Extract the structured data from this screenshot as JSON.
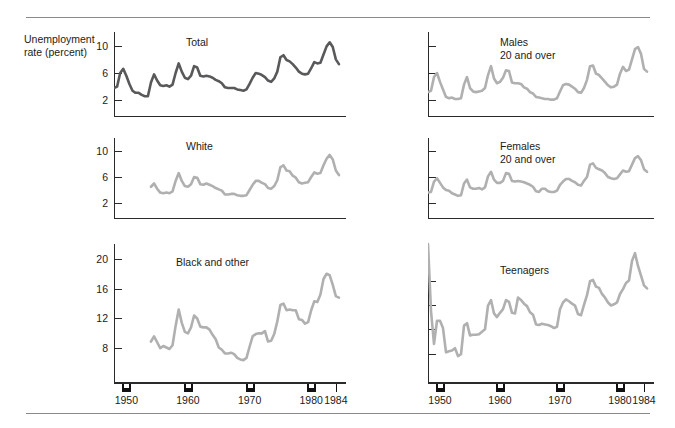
{
  "figure": {
    "axis_caption": "Unemployment\nrate (percent)",
    "line_color_primary": "#59595b",
    "line_color_secondary": "#b0b0b0",
    "axis_color": "#2a2a2a",
    "rule_color": "#8a8a8a"
  },
  "xaxis": {
    "tick_labels": [
      "1950",
      "1960",
      "1970",
      "1980",
      "1984"
    ],
    "tick_years": [
      1950,
      1960,
      1970,
      1980,
      1984
    ],
    "range": [
      1948,
      1985
    ]
  },
  "chart_data": [
    {
      "type": "line",
      "title": "Total",
      "panel": "top-left",
      "ylabel": "Unemployment rate (percent)",
      "xlabel": "",
      "ylim": [
        0,
        12
      ],
      "yticks": [
        2,
        6,
        10
      ],
      "ytick_labels": [
        "2",
        "6",
        "10"
      ],
      "grid": false,
      "legend": "none",
      "color": "#59595b",
      "x": [
        1948,
        1948.5,
        1949,
        1949.5,
        1950,
        1950.5,
        1951,
        1951.5,
        1952,
        1952.5,
        1953,
        1953.5,
        1954,
        1954.5,
        1955,
        1955.5,
        1956,
        1956.5,
        1957,
        1957.5,
        1958,
        1958.5,
        1959,
        1959.5,
        1960,
        1960.5,
        1961,
        1961.5,
        1962,
        1962.5,
        1963,
        1963.5,
        1964,
        1964.5,
        1965,
        1965.5,
        1966,
        1966.5,
        1967,
        1967.5,
        1968,
        1968.5,
        1969,
        1969.5,
        1970,
        1970.5,
        1971,
        1971.5,
        1972,
        1972.5,
        1973,
        1973.5,
        1974,
        1974.5,
        1975,
        1975.5,
        1976,
        1976.5,
        1977,
        1977.5,
        1978,
        1978.5,
        1979,
        1979.5,
        1980,
        1980.5,
        1981,
        1981.5,
        1982,
        1982.5,
        1983,
        1983.5,
        1984,
        1984.5
      ],
      "y": [
        3.8,
        4.0,
        6.0,
        6.6,
        5.6,
        4.4,
        3.4,
        3.1,
        3.1,
        2.8,
        2.6,
        2.6,
        4.6,
        5.8,
        4.9,
        4.2,
        4.1,
        4.2,
        4.0,
        4.3,
        6.0,
        7.4,
        6.2,
        5.3,
        5.1,
        5.6,
        7.0,
        6.8,
        5.6,
        5.5,
        5.6,
        5.5,
        5.3,
        5.0,
        4.8,
        4.5,
        3.9,
        3.8,
        3.8,
        3.8,
        3.6,
        3.5,
        3.4,
        3.6,
        4.4,
        5.3,
        6.0,
        5.9,
        5.7,
        5.4,
        4.9,
        4.7,
        5.2,
        6.2,
        8.3,
        8.6,
        7.9,
        7.7,
        7.3,
        6.8,
        6.2,
        5.9,
        5.8,
        5.9,
        6.7,
        7.6,
        7.4,
        7.5,
        8.7,
        9.9,
        10.5,
        9.8,
        8.0,
        7.3
      ],
      "notes": "line drawn darker than the other five panels"
    },
    {
      "type": "line",
      "title": "White",
      "panel": "middle-left",
      "ylabel": "",
      "xlabel": "",
      "ylim": [
        0,
        12
      ],
      "yticks": [
        2,
        6,
        10
      ],
      "ytick_labels": [
        "2",
        "6",
        "10"
      ],
      "grid": false,
      "legend": "none",
      "color": "#b0b0b0",
      "x": [
        1954,
        1954.5,
        1955,
        1955.5,
        1956,
        1956.5,
        1957,
        1957.5,
        1958,
        1958.5,
        1959,
        1959.5,
        1960,
        1960.5,
        1961,
        1961.5,
        1962,
        1962.5,
        1963,
        1963.5,
        1964,
        1964.5,
        1965,
        1965.5,
        1966,
        1966.5,
        1967,
        1967.5,
        1968,
        1968.5,
        1969,
        1969.5,
        1970,
        1970.5,
        1971,
        1971.5,
        1972,
        1972.5,
        1973,
        1973.5,
        1974,
        1974.5,
        1975,
        1975.5,
        1976,
        1976.5,
        1977,
        1977.5,
        1978,
        1978.5,
        1979,
        1979.5,
        1980,
        1980.5,
        1981,
        1981.5,
        1982,
        1982.5,
        1983,
        1983.5,
        1984,
        1984.5
      ],
      "y": [
        4.5,
        5.0,
        4.2,
        3.6,
        3.5,
        3.6,
        3.5,
        3.8,
        5.4,
        6.6,
        5.4,
        4.6,
        4.5,
        4.9,
        6.0,
        5.9,
        4.9,
        4.8,
        5.0,
        4.8,
        4.6,
        4.3,
        4.1,
        3.9,
        3.3,
        3.3,
        3.4,
        3.4,
        3.2,
        3.1,
        3.1,
        3.2,
        4.0,
        4.8,
        5.4,
        5.4,
        5.1,
        4.9,
        4.3,
        4.2,
        4.6,
        5.5,
        7.5,
        7.8,
        7.0,
        6.9,
        6.2,
        5.9,
        5.2,
        5.0,
        5.1,
        5.2,
        6.0,
        6.7,
        6.5,
        6.6,
        7.8,
        8.8,
        9.4,
        8.7,
        7.0,
        6.3
      ],
      "notes": "series begins about 1954"
    },
    {
      "type": "line",
      "title": "Black and other",
      "panel": "bottom-left",
      "ylabel": "",
      "xlabel": "",
      "ylim": [
        4,
        22
      ],
      "yticks": [
        8,
        12,
        16,
        20
      ],
      "ytick_labels": [
        "8",
        "12",
        "16",
        "20"
      ],
      "grid": false,
      "legend": "none",
      "color": "#b0b0b0",
      "x": [
        1954,
        1954.5,
        1955,
        1955.5,
        1956,
        1956.5,
        1957,
        1957.5,
        1958,
        1958.5,
        1959,
        1959.5,
        1960,
        1960.5,
        1961,
        1961.5,
        1962,
        1962.5,
        1963,
        1963.5,
        1964,
        1964.5,
        1965,
        1965.5,
        1966,
        1966.5,
        1967,
        1967.5,
        1968,
        1968.5,
        1969,
        1969.5,
        1970,
        1970.5,
        1971,
        1971.5,
        1972,
        1972.5,
        1973,
        1973.5,
        1974,
        1974.5,
        1975,
        1975.5,
        1976,
        1976.5,
        1977,
        1977.5,
        1978,
        1978.5,
        1979,
        1979.5,
        1980,
        1980.5,
        1981,
        1981.5,
        1982,
        1982.5,
        1983,
        1983.5,
        1984,
        1984.5
      ],
      "y": [
        8.9,
        9.6,
        8.8,
        8.0,
        8.3,
        8.1,
        7.9,
        8.4,
        11.0,
        13.2,
        11.4,
        10.2,
        10.0,
        10.8,
        12.4,
        12.0,
        10.9,
        10.8,
        10.8,
        10.5,
        9.8,
        9.2,
        8.1,
        7.8,
        7.3,
        7.3,
        7.4,
        7.2,
        6.7,
        6.5,
        6.4,
        6.7,
        8.2,
        9.6,
        9.9,
        10.0,
        10.0,
        10.3,
        8.9,
        9.0,
        9.9,
        11.6,
        13.8,
        14.0,
        13.1,
        13.2,
        13.1,
        13.1,
        11.9,
        11.8,
        11.3,
        11.5,
        13.1,
        14.3,
        14.2,
        15.2,
        17.3,
        18.0,
        17.8,
        16.5,
        15.0,
        14.8
      ],
      "notes": "series begins about 1954"
    },
    {
      "type": "line",
      "title": "Males\n20 and over",
      "panel": "top-right",
      "ylabel": "",
      "xlabel": "",
      "ylim": [
        0,
        12
      ],
      "yticks": [
        2,
        6,
        10
      ],
      "ytick_labels": [
        "",
        "",
        ""
      ],
      "grid": false,
      "legend": "none",
      "color": "#b0b0b0",
      "x": [
        1948,
        1948.5,
        1949,
        1949.5,
        1950,
        1950.5,
        1951,
        1951.5,
        1952,
        1952.5,
        1953,
        1953.5,
        1954,
        1954.5,
        1955,
        1955.5,
        1956,
        1956.5,
        1957,
        1957.5,
        1958,
        1958.5,
        1959,
        1959.5,
        1960,
        1960.5,
        1961,
        1961.5,
        1962,
        1962.5,
        1963,
        1963.5,
        1964,
        1964.5,
        1965,
        1965.5,
        1966,
        1966.5,
        1967,
        1967.5,
        1968,
        1968.5,
        1969,
        1969.5,
        1970,
        1970.5,
        1971,
        1971.5,
        1972,
        1972.5,
        1973,
        1973.5,
        1974,
        1974.5,
        1975,
        1975.5,
        1976,
        1976.5,
        1977,
        1977.5,
        1978,
        1978.5,
        1979,
        1979.5,
        1980,
        1980.5,
        1981,
        1981.5,
        1982,
        1982.5,
        1983,
        1983.5,
        1984,
        1984.5
      ],
      "y": [
        3.2,
        3.4,
        5.4,
        6.0,
        4.7,
        3.6,
        2.5,
        2.3,
        2.4,
        2.2,
        2.2,
        2.3,
        4.3,
        5.4,
        3.8,
        3.3,
        3.2,
        3.3,
        3.4,
        3.8,
        5.7,
        7.0,
        5.2,
        4.5,
        4.7,
        5.3,
        6.4,
        6.3,
        4.6,
        4.5,
        4.5,
        4.4,
        3.9,
        3.7,
        3.2,
        3.0,
        2.5,
        2.4,
        2.3,
        2.2,
        2.2,
        2.1,
        2.1,
        2.3,
        3.3,
        4.2,
        4.4,
        4.3,
        4.0,
        3.7,
        3.2,
        3.1,
        3.8,
        5.0,
        7.0,
        7.1,
        5.9,
        5.7,
        5.2,
        4.7,
        4.2,
        3.9,
        4.0,
        4.3,
        5.9,
        6.9,
        6.3,
        6.5,
        8.0,
        9.5,
        9.8,
        8.8,
        6.6,
        6.2
      ]
    },
    {
      "type": "line",
      "title": "Females\n20 and over",
      "panel": "middle-right",
      "ylabel": "",
      "xlabel": "",
      "ylim": [
        0,
        12
      ],
      "yticks": [
        2,
        6,
        10
      ],
      "ytick_labels": [
        "",
        "",
        ""
      ],
      "grid": false,
      "legend": "none",
      "color": "#b0b0b0",
      "x": [
        1948,
        1948.5,
        1949,
        1949.5,
        1950,
        1950.5,
        1951,
        1951.5,
        1952,
        1952.5,
        1953,
        1953.5,
        1954,
        1954.5,
        1955,
        1955.5,
        1956,
        1956.5,
        1957,
        1957.5,
        1958,
        1958.5,
        1959,
        1959.5,
        1960,
        1960.5,
        1961,
        1961.5,
        1962,
        1962.5,
        1963,
        1963.5,
        1964,
        1964.5,
        1965,
        1965.5,
        1966,
        1966.5,
        1967,
        1967.5,
        1968,
        1968.5,
        1969,
        1969.5,
        1970,
        1970.5,
        1971,
        1971.5,
        1972,
        1972.5,
        1973,
        1973.5,
        1974,
        1974.5,
        1975,
        1975.5,
        1976,
        1976.5,
        1977,
        1977.5,
        1978,
        1978.5,
        1979,
        1979.5,
        1980,
        1980.5,
        1981,
        1981.5,
        1982,
        1982.5,
        1983,
        1983.5,
        1984,
        1984.5
      ],
      "y": [
        3.6,
        3.7,
        5.3,
        5.8,
        5.1,
        4.4,
        4.0,
        3.9,
        3.5,
        3.3,
        3.1,
        3.2,
        5.0,
        5.6,
        4.4,
        4.2,
        4.2,
        4.3,
        4.1,
        4.4,
        6.1,
        6.8,
        5.6,
        5.1,
        5.1,
        5.4,
        6.6,
        6.5,
        5.4,
        5.3,
        5.4,
        5.3,
        5.2,
        5.0,
        4.8,
        4.5,
        3.8,
        3.7,
        4.2,
        4.2,
        3.8,
        3.7,
        3.7,
        3.9,
        4.8,
        5.3,
        5.7,
        5.7,
        5.4,
        5.2,
        4.8,
        4.7,
        5.4,
        6.0,
        7.9,
        8.1,
        7.4,
        7.2,
        7.0,
        6.6,
        6.0,
        5.8,
        5.7,
        5.8,
        6.4,
        7.0,
        6.8,
        6.9,
        7.9,
        8.9,
        9.2,
        8.6,
        7.2,
        6.8
      ]
    },
    {
      "type": "line",
      "title": "Teenagers",
      "panel": "bottom-right",
      "ylabel": "",
      "xlabel": "",
      "ylim": [
        4,
        26
      ],
      "yticks": [
        8,
        12,
        16,
        20
      ],
      "ytick_labels": [
        "",
        "",
        "",
        ""
      ],
      "grid": false,
      "legend": "none",
      "color": "#b0b0b0",
      "x": [
        1948,
        1948.5,
        1949,
        1949.5,
        1950,
        1950.5,
        1951,
        1951.5,
        1952,
        1952.5,
        1953,
        1953.5,
        1954,
        1954.5,
        1955,
        1955.5,
        1956,
        1956.5,
        1957,
        1957.5,
        1958,
        1958.5,
        1959,
        1959.5,
        1960,
        1960.5,
        1961,
        1961.5,
        1962,
        1962.5,
        1963,
        1963.5,
        1964,
        1964.5,
        1965,
        1965.5,
        1966,
        1966.5,
        1967,
        1967.5,
        1968,
        1968.5,
        1969,
        1969.5,
        1970,
        1970.5,
        1971,
        1971.5,
        1972,
        1972.5,
        1973,
        1973.5,
        1974,
        1974.5,
        1975,
        1975.5,
        1976,
        1976.5,
        1977,
        1977.5,
        1978,
        1978.5,
        1979,
        1979.5,
        1980,
        1980.5,
        1981,
        1981.5,
        1982,
        1982.5,
        1983,
        1983.5,
        1984,
        1984.5
      ],
      "y": [
        26.0,
        15.0,
        9.6,
        13.4,
        13.4,
        12.2,
        8.2,
        8.4,
        8.5,
        8.9,
        7.6,
        7.9,
        12.6,
        13.0,
        11.0,
        11.1,
        11.1,
        11.2,
        11.6,
        12.0,
        15.9,
        16.8,
        14.6,
        14.0,
        14.7,
        15.3,
        16.8,
        16.5,
        14.7,
        14.6,
        17.2,
        16.8,
        16.2,
        15.8,
        14.8,
        14.4,
        12.8,
        12.7,
        12.9,
        12.8,
        12.7,
        12.5,
        12.2,
        12.4,
        15.3,
        16.4,
        16.9,
        16.6,
        16.2,
        15.9,
        14.5,
        14.3,
        16.0,
        17.6,
        19.9,
        20.1,
        19.0,
        18.8,
        17.8,
        17.2,
        16.4,
        15.9,
        16.1,
        16.4,
        17.8,
        18.6,
        19.6,
        20.0,
        23.2,
        24.5,
        22.4,
        20.8,
        19.2,
        18.7
      ],
      "notes": "series peaks above the top of the plotting frame near 1948 and again near 1982"
    }
  ]
}
